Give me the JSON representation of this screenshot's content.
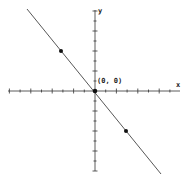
{
  "chart_data": {
    "type": "line",
    "title": "",
    "xlabel": "x",
    "ylabel": "y",
    "origin_label": "(0, 0)",
    "xlim": [
      -8,
      8
    ],
    "ylim": [
      -8,
      8
    ],
    "grid": false,
    "legend": null,
    "series": [
      {
        "name": "line",
        "equation": "y = -4/3 x",
        "slope": -1.333,
        "intercept": 0,
        "x": [
          -6.5,
          6.2
        ],
        "y": [
          8.2,
          -8.3
        ]
      }
    ],
    "points": [
      {
        "x": -3,
        "y": 4
      },
      {
        "x": 0,
        "y": 0
      },
      {
        "x": 3,
        "y": -4
      }
    ]
  },
  "axes": {
    "x_label": "x",
    "y_label": "y",
    "origin_label": "(0, 0)"
  },
  "colors": {
    "axis": "#333333",
    "line": "#444444",
    "point": "#111111"
  }
}
